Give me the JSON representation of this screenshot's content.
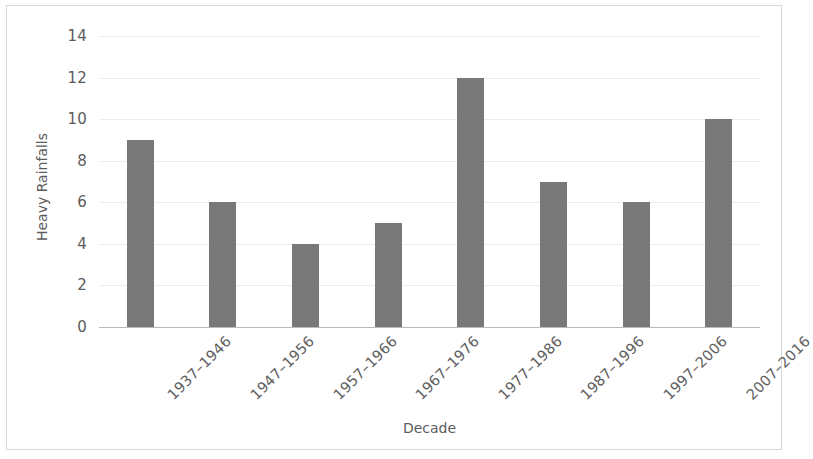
{
  "figure": {
    "background_color": "#ffffff",
    "frame_color": "#9a9a9a",
    "bar_color": "#787878",
    "gridline_color": "#ededed",
    "axis_color": "#b9b9b9",
    "text_color": "#5c5c5c"
  },
  "chart_data": {
    "type": "bar",
    "title": "",
    "xlabel": "Decade",
    "ylabel": "Heavy Rainfalls",
    "categories": [
      "1937–1946",
      "1947–1956",
      "1957–1966",
      "1967–1976",
      "1977–1986",
      "1987–1996",
      "1997–2006",
      "2007–2016"
    ],
    "values": [
      9,
      6,
      4,
      5,
      12,
      7,
      6,
      10
    ],
    "ylim": [
      0,
      14
    ],
    "ytick_values": [
      0,
      2,
      4,
      6,
      8,
      10,
      12,
      14
    ],
    "ytick_labels": [
      "0",
      "2",
      "4",
      "6",
      "8",
      "10",
      "12",
      "14"
    ],
    "ytick_step": 2,
    "grid": true,
    "grid_axis": "y",
    "legend": null,
    "legend_position": "none",
    "xtick_label_rotation": -45,
    "series": [
      {
        "name": "Heavy Rainfalls",
        "values": [
          9,
          6,
          4,
          5,
          12,
          7,
          6,
          10
        ]
      }
    ]
  }
}
